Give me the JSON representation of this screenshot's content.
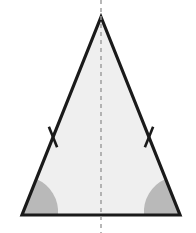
{
  "figure": {
    "description": "An isosceles triangle shaded light gray, with a vertical dashed line of symmetry from the apex through the midpoint of the base, single tick marks on each of the two congruent legs, and the two congruent base angles marked with shaded gray sectors.",
    "width": 196,
    "height": 233,
    "background_color": "#ffffff"
  },
  "colors": {
    "outline": "#1a1a1a",
    "interior_fill": "#efefef",
    "angle_sector_fill": "#b9b9b9",
    "symmetry_line": "#9a9a9a",
    "tick_mark": "#1a1a1a"
  },
  "geometry": {
    "apex": {
      "label": "apex-vertex",
      "x": 101,
      "y": 17
    },
    "base_left": {
      "label": "base-left-vertex",
      "x": 22,
      "y": 215
    },
    "base_right": {
      "label": "base-right-vertex",
      "x": 180,
      "y": 215
    },
    "base_midpoint": {
      "label": "base-midpoint",
      "x": 101,
      "y": 215
    },
    "outline_width": 3.2,
    "base_width": 158,
    "triangle_height": 198
  },
  "symmetry_line": {
    "label": "axis of symmetry",
    "x": 101,
    "y_top": 0,
    "y_bottom": 233,
    "stroke_width": 1.4,
    "dash_pattern": "4 4"
  },
  "tick_marks": [
    {
      "name": "left-leg-tick",
      "center_x": 53,
      "center_y": 137,
      "angle_deg": 68,
      "length": 22,
      "stroke_width": 2.6
    },
    {
      "name": "right-leg-tick",
      "center_x": 149,
      "center_y": 137,
      "angle_deg": 112,
      "length": 22,
      "stroke_width": 2.6
    }
  ],
  "angle_sectors": [
    {
      "name": "left-base-angle-sector",
      "vertex_x": 22,
      "vertex_y": 215,
      "radius": 36,
      "start_x": 58,
      "start_y": 215,
      "end_x": 36.4,
      "end_y": 179.1
    },
    {
      "name": "right-base-angle-sector",
      "vertex_x": 180,
      "vertex_y": 215,
      "radius": 36,
      "start_x": 165.6,
      "start_y": 179.1,
      "end_x": 144,
      "end_y": 215
    }
  ]
}
